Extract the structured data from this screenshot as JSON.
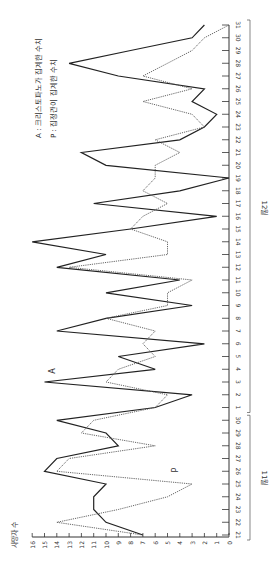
{
  "chart_data": {
    "type": "line",
    "orientation": "rotated-90-clockwise",
    "title": "",
    "xlabel": "날짜 (11월 21일 ~ 12월 31일)",
    "ylabel": "사망자 수",
    "ylim": [
      0,
      16
    ],
    "y_ticks": [
      0,
      1,
      2,
      3,
      4,
      5,
      6,
      7,
      8,
      9,
      10,
      11,
      12,
      13,
      14,
      15,
      16
    ],
    "month_groups": [
      {
        "label": "11월",
        "from": "21",
        "to": "30"
      },
      {
        "label": "12월",
        "from": "1",
        "to": "31"
      }
    ],
    "x": [
      "21",
      "22",
      "23",
      "24",
      "25",
      "26",
      "27",
      "28",
      "29",
      "30",
      "1",
      "2",
      "3",
      "4",
      "5",
      "6",
      "7",
      "8",
      "9",
      "10",
      "11",
      "12",
      "13",
      "14",
      "15",
      "16",
      "17",
      "18",
      "19",
      "20",
      "21",
      "22",
      "23",
      "24",
      "25",
      "26",
      "27",
      "28",
      "29",
      "30",
      "31"
    ],
    "series": [
      {
        "name": "A",
        "legend": "A : 크리스토파노가 집계한 수치",
        "style": "solid",
        "color": "#222222",
        "values": [
          7,
          10,
          11,
          11,
          10,
          15,
          14,
          9,
          10,
          14,
          6,
          3,
          15,
          6,
          9,
          2,
          14,
          10,
          3,
          10,
          4,
          14,
          10,
          16,
          8,
          1,
          11,
          4,
          0,
          10,
          12,
          4,
          2,
          1,
          3,
          2,
          9,
          13,
          8,
          3,
          2
        ]
      },
      {
        "name": "P",
        "legend": "P : 집정관이 집계한 수치",
        "style": "dotted",
        "color": "#555555",
        "values": [
          7,
          14,
          9,
          5,
          3,
          14,
          13,
          6,
          12,
          11,
          6,
          5,
          10,
          9,
          6,
          7,
          6,
          10,
          5,
          5,
          3,
          13,
          5,
          5,
          8,
          7,
          5,
          7,
          6,
          6,
          4,
          6,
          2,
          3,
          7,
          3,
          7,
          5,
          3,
          2,
          0
        ]
      }
    ],
    "annotations": [
      {
        "text": "A",
        "near_series": "A"
      },
      {
        "text": "P",
        "near_series": "P"
      }
    ],
    "legend_position": "top-left (rotated)",
    "grid": false
  },
  "labels": {
    "y_axis_title": "사망자 수",
    "month_nov": "11월",
    "month_dec": "12월",
    "legend_a": "A : 크리스토파노가 집계한 수치",
    "legend_p": "P : 집정관이 집계한 수치",
    "series_a_tag": "A",
    "series_p_tag": "P"
  }
}
